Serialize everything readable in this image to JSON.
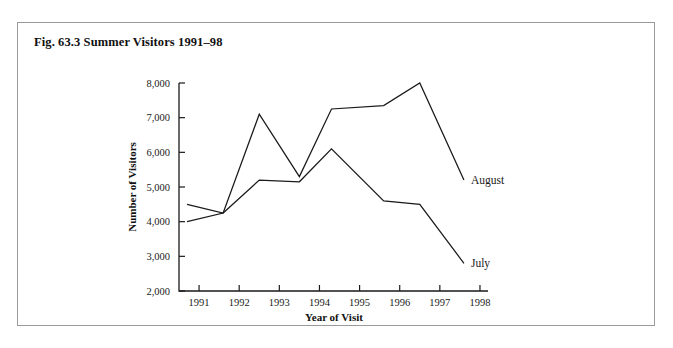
{
  "figure": {
    "caption": "Fig. 63.3 Summer Visitors 1991–98",
    "border_color": "#9a9a9a",
    "background_color": "#ffffff"
  },
  "chart_data": {
    "type": "line",
    "title": "Fig. 63.3 Summer Visitors 1991–98",
    "xlabel": "Year of Visit",
    "ylabel": "Number of Visitors",
    "xlim": [
      1990.5,
      1998.2
    ],
    "ylim": [
      2000,
      8000
    ],
    "grid": false,
    "legend_position": "right-inline",
    "x_tick_labels": [
      "1991",
      "1992",
      "1993",
      "1994",
      "1995",
      "1996",
      "1997",
      "1998"
    ],
    "x_ticks": [
      1991,
      1992,
      1993,
      1994,
      1995,
      1996,
      1997,
      1998
    ],
    "y_tick_labels": [
      "2,000",
      "3,000",
      "4,000",
      "5,000",
      "6,000",
      "7,000",
      "8,000"
    ],
    "y_ticks": [
      2000,
      3000,
      4000,
      5000,
      6000,
      7000,
      8000
    ],
    "line_color": "#1a1a1a",
    "series": [
      {
        "name": "August",
        "label": "August",
        "x": [
          1990.7,
          1991.6,
          1992.5,
          1993.5,
          1994.3,
          1995.6,
          1996.5,
          1997.6
        ],
        "values": [
          4000,
          4250,
          7100,
          5300,
          7250,
          7350,
          8000,
          5200
        ]
      },
      {
        "name": "July",
        "label": "July",
        "x": [
          1990.7,
          1991.6,
          1992.5,
          1993.5,
          1994.3,
          1995.6,
          1996.5,
          1997.6
        ],
        "values": [
          4500,
          4250,
          5200,
          5150,
          6100,
          4600,
          4500,
          2800
        ]
      }
    ]
  }
}
